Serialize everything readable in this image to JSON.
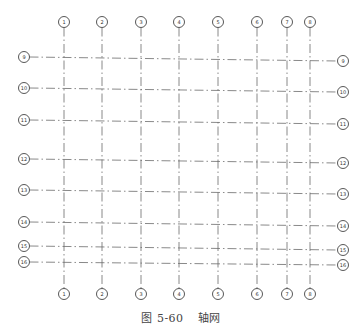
{
  "figure": {
    "caption_number": "图 5-60",
    "caption_title": "轴网"
  },
  "style": {
    "line_color": "#6b6b6b",
    "bubble_stroke": "#444444",
    "text_color": "#333333",
    "background": "#ffffff"
  },
  "grid": {
    "vertical_axes": [
      {
        "label": "1",
        "x": 64
      },
      {
        "label": "2",
        "x": 102
      },
      {
        "label": "3",
        "x": 141
      },
      {
        "label": "4",
        "x": 179
      },
      {
        "label": "5",
        "x": 218
      },
      {
        "label": "6",
        "x": 257
      },
      {
        "label": "7",
        "x": 287
      },
      {
        "label": "8",
        "x": 310
      }
    ],
    "vertical_extent": {
      "top_bubble_y": 22,
      "bottom_bubble_y": 294
    },
    "horizontal_axes": [
      {
        "label": "9",
        "y_left": 57,
        "y_right": 61
      },
      {
        "label": "10",
        "y_left": 88,
        "y_right": 92
      },
      {
        "label": "11",
        "y_left": 120,
        "y_right": 124
      },
      {
        "label": "12",
        "y_left": 159,
        "y_right": 163
      },
      {
        "label": "13",
        "y_left": 190,
        "y_right": 194
      },
      {
        "label": "14",
        "y_left": 222,
        "y_right": 226
      },
      {
        "label": "15",
        "y_left": 246,
        "y_right": 250
      },
      {
        "label": "16",
        "y_left": 262,
        "y_right": 265
      }
    ],
    "horizontal_extent": {
      "left_bubble_x": 24,
      "right_bubble_x": 343
    },
    "bubble_radius": 5.5
  }
}
